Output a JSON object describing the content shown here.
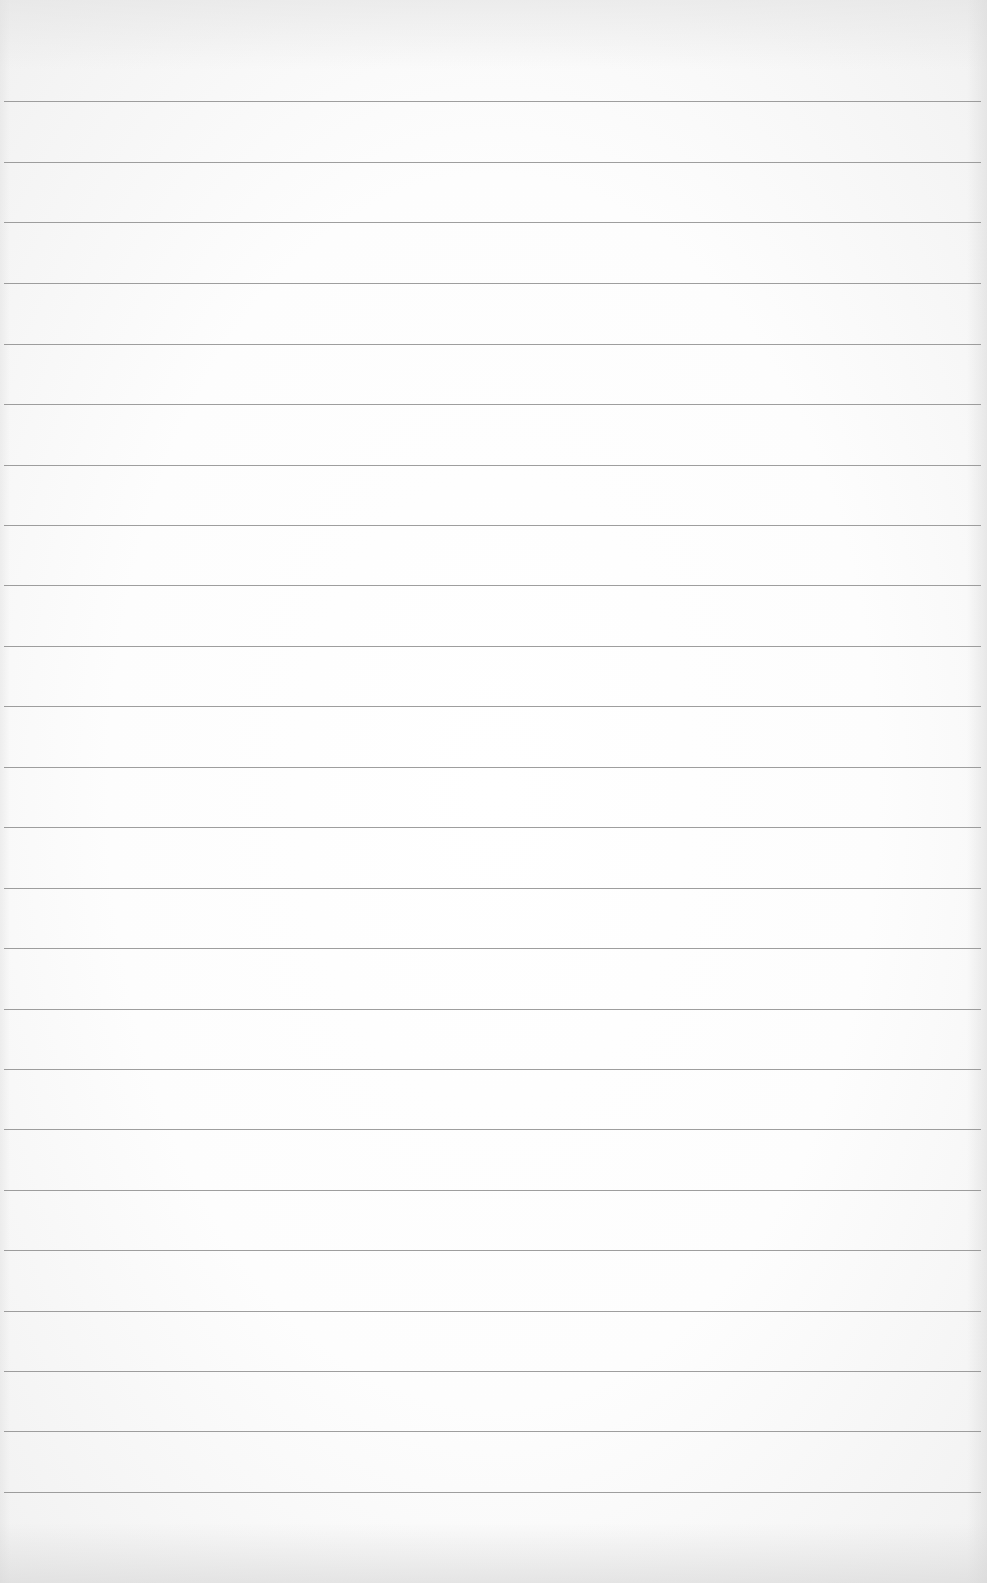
{
  "page": {
    "type": "ruled-paper",
    "background_color": "#fdfdfd",
    "rule_color": "#8d8d8d",
    "rule_count": 24,
    "rules_y": [
      101,
      162,
      222,
      283,
      344,
      404,
      465,
      525,
      585,
      646,
      706,
      767,
      827,
      888,
      948,
      1009,
      1069,
      1129,
      1190,
      1250,
      1311,
      1371,
      1431,
      1492
    ],
    "lines_text": [
      "",
      "",
      "",
      "",
      "",
      "",
      "",
      "",
      "",
      "",
      "",
      "",
      "",
      "",
      "",
      "",
      "",
      "",
      "",
      "",
      "",
      "",
      "",
      ""
    ]
  }
}
